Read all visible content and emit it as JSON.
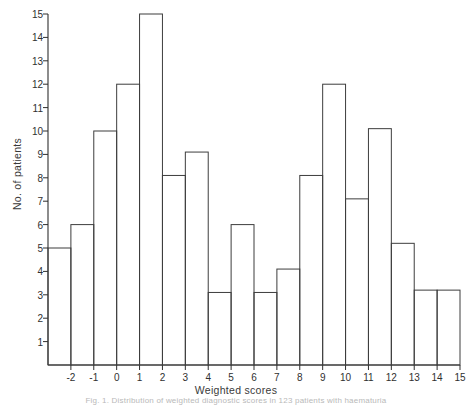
{
  "chart_data": {
    "type": "bar",
    "title": "",
    "xlabel": "Weighted scores",
    "ylabel": "No. of patients",
    "grid": false,
    "legend": null,
    "xlim": [
      -3,
      15
    ],
    "ylim": [
      0,
      15
    ],
    "bin_width": 1,
    "x_tick_labels": [
      "-2",
      "-1",
      "0",
      "1",
      "2",
      "3",
      "4",
      "5",
      "6",
      "7",
      "8",
      "9",
      "10",
      "11",
      "12",
      "13",
      "14",
      "15"
    ],
    "x_tick_values": [
      -2,
      -1,
      0,
      1,
      2,
      3,
      4,
      5,
      6,
      7,
      8,
      9,
      10,
      11,
      12,
      13,
      14,
      15
    ],
    "y_tick_labels": [
      "1",
      "2",
      "3",
      "4",
      "5",
      "6",
      "7",
      "8",
      "9",
      "10",
      "11",
      "12",
      "13",
      "14",
      "15"
    ],
    "y_tick_values": [
      1,
      2,
      3,
      4,
      5,
      6,
      7,
      8,
      9,
      10,
      11,
      12,
      13,
      14,
      15
    ],
    "bins": [
      {
        "start": -3,
        "end": -2,
        "value": 5
      },
      {
        "start": -2,
        "end": -1,
        "value": 6
      },
      {
        "start": -1,
        "end": 0,
        "value": 10
      },
      {
        "start": 0,
        "end": 1,
        "value": 12
      },
      {
        "start": 1,
        "end": 2,
        "value": 15
      },
      {
        "start": 2,
        "end": 3,
        "value": 8.1
      },
      {
        "start": 3,
        "end": 4,
        "value": 9.1
      },
      {
        "start": 4,
        "end": 5,
        "value": 3.1
      },
      {
        "start": 5,
        "end": 6,
        "value": 6
      },
      {
        "start": 6,
        "end": 7,
        "value": 3.1
      },
      {
        "start": 7,
        "end": 8,
        "value": 4.1
      },
      {
        "start": 8,
        "end": 9,
        "value": 8.1
      },
      {
        "start": 9,
        "end": 10,
        "value": 12
      },
      {
        "start": 10,
        "end": 11,
        "value": 7.1
      },
      {
        "start": 11,
        "end": 12,
        "value": 10.1
      },
      {
        "start": 12,
        "end": 13,
        "value": 5.2
      },
      {
        "start": 13,
        "end": 14,
        "value": 3.2
      },
      {
        "start": 14,
        "end": 15,
        "value": 3.2
      }
    ],
    "categories": [
      "-3..-2",
      "-2..-1",
      "-1..0",
      "0..1",
      "1..2",
      "2..3",
      "3..4",
      "4..5",
      "5..6",
      "6..7",
      "7..8",
      "8..9",
      "9..10",
      "10..11",
      "11..12",
      "12..13",
      "13..14",
      "14..15"
    ],
    "values": [
      5,
      6,
      10,
      12,
      15,
      8.1,
      9.1,
      3.1,
      6,
      3.1,
      4.1,
      8.1,
      12,
      7.1,
      10.1,
      5.2,
      3.2,
      3.2
    ]
  },
  "axes": {
    "y_axis_title": "No. of patients",
    "x_axis_title": "Weighted scores"
  },
  "caption": {
    "text": "Fig. 1. Distribution of weighted diagnostic scores in 123 patients with haematuria"
  },
  "colors": {
    "line": "#3d3d3d",
    "axis": "#2e2e2e",
    "text": "#2b2b2b",
    "background": "#ffffff"
  }
}
